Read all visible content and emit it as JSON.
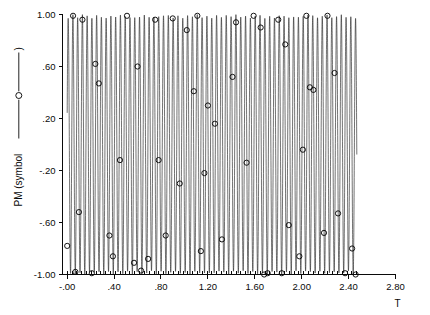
{
  "chart_data": {
    "type": "line",
    "title": "",
    "subtitle": "",
    "xlabel": "T",
    "ylabel": "PM  (symbol  ——⊕——)",
    "ylabel_text_prefix": "PM  (symbol",
    "ylabel_text_suffix": ")",
    "xlim": [
      -0.04,
      2.8
    ],
    "ylim": [
      -1.0,
      1.0
    ],
    "xticks": [
      0.0,
      0.4,
      0.8,
      1.2,
      1.6,
      2.0,
      2.4,
      2.8
    ],
    "xticklabels": [
      "-.00",
      ".40",
      ".80",
      "1.20",
      "1.60",
      "2.00",
      "2.40",
      "2.80"
    ],
    "yticks": [
      1.0,
      0.6,
      0.2,
      -0.2,
      -0.6,
      -1.0
    ],
    "yticklabels": [
      "1.00",
      ".60",
      ".20",
      "-.20",
      "-.60",
      "-1.00"
    ],
    "grid": false,
    "legend_position": "y-axis-label",
    "minor_xticks_count": 60,
    "curve_x_start": 0.0,
    "curve_x_end": 2.47,
    "oscillation_frequency_hz": 24.5,
    "envelope_amplitude": 1.0,
    "series": [
      {
        "name": "PM",
        "style": "line-with-circle-symbols",
        "marker": "open-circle",
        "marker_radius_px": 2.6,
        "color": "#1c1c1c",
        "x": [
          0.0,
          0.02,
          0.05,
          0.07,
          0.1,
          0.13,
          0.15,
          0.18,
          0.21,
          0.24,
          0.27,
          0.3,
          0.33,
          0.36,
          0.39,
          0.42,
          0.45,
          0.48,
          0.51,
          0.54,
          0.57,
          0.6,
          0.63,
          0.66,
          0.69,
          0.72,
          0.75,
          0.78,
          0.81,
          0.84,
          0.87,
          0.9,
          0.93,
          0.96,
          0.99,
          1.02,
          1.05,
          1.08,
          1.11,
          1.14,
          1.17,
          1.2,
          1.23,
          1.26,
          1.29,
          1.32,
          1.35,
          1.38,
          1.41,
          1.44,
          1.47,
          1.5,
          1.53,
          1.56,
          1.59,
          1.62,
          1.65,
          1.68,
          1.71,
          1.74,
          1.77,
          1.8,
          1.83,
          1.86,
          1.89,
          1.92,
          1.95,
          1.98,
          2.01,
          2.04,
          2.07,
          2.1,
          2.13,
          2.16,
          2.19,
          2.22,
          2.25,
          2.28,
          2.31,
          2.34,
          2.37,
          2.4,
          2.43,
          2.46
        ],
        "y": [
          -0.93,
          -1.0,
          0.98,
          -0.86,
          -0.52,
          0.96,
          -0.99,
          0.94,
          -0.99,
          0.62,
          0.47,
          -0.72,
          -0.98,
          0.99,
          -0.84,
          -0.12,
          0.99,
          -0.98,
          0.95,
          -0.86,
          -0.91,
          0.6,
          -0.99,
          0.86,
          -0.97,
          0.98,
          -0.94,
          -0.12,
          0.99,
          -0.7,
          0.93,
          -0.99,
          0.97,
          -0.3,
          -0.98,
          0.88,
          -0.99,
          0.41,
          0.99,
          -0.82,
          -0.22,
          0.3,
          -0.99,
          0.16,
          0.99,
          -0.73,
          0.98,
          -0.99,
          0.52,
          0.94,
          -0.99,
          0.97,
          -0.14,
          -0.99,
          0.99,
          -0.88,
          0.9,
          -1.0,
          -0.99,
          0.98,
          -0.92,
          0.96,
          -0.99,
          0.77,
          -0.62,
          -0.99,
          0.98,
          -0.86,
          -0.04,
          0.99,
          0.44,
          0.42,
          -0.99,
          0.96,
          -0.68,
          0.99,
          -0.98,
          0.55,
          -0.53,
          0.99,
          -0.99,
          0.97,
          -0.8,
          -1.0
        ],
        "marker_points": [
          {
            "x": 0.0,
            "y": -0.78
          },
          {
            "x": 0.05,
            "y": 0.99
          },
          {
            "x": 0.07,
            "y": -0.98
          },
          {
            "x": 0.1,
            "y": -0.52
          },
          {
            "x": 0.13,
            "y": 0.96
          },
          {
            "x": 0.21,
            "y": -0.99
          },
          {
            "x": 0.24,
            "y": 0.62
          },
          {
            "x": 0.27,
            "y": 0.47
          },
          {
            "x": 0.36,
            "y": -0.7
          },
          {
            "x": 0.39,
            "y": -0.86
          },
          {
            "x": 0.45,
            "y": -0.12
          },
          {
            "x": 0.51,
            "y": 0.99
          },
          {
            "x": 0.57,
            "y": -0.91
          },
          {
            "x": 0.6,
            "y": 0.6
          },
          {
            "x": 0.63,
            "y": -0.97
          },
          {
            "x": 0.69,
            "y": -0.88
          },
          {
            "x": 0.75,
            "y": 0.96
          },
          {
            "x": 0.78,
            "y": -0.12
          },
          {
            "x": 0.84,
            "y": -0.7
          },
          {
            "x": 0.9,
            "y": 0.97
          },
          {
            "x": 0.96,
            "y": -0.3
          },
          {
            "x": 1.02,
            "y": 0.88
          },
          {
            "x": 1.08,
            "y": 0.41
          },
          {
            "x": 1.11,
            "y": 0.99
          },
          {
            "x": 1.14,
            "y": -0.82
          },
          {
            "x": 1.17,
            "y": -0.22
          },
          {
            "x": 1.2,
            "y": 0.3
          },
          {
            "x": 1.26,
            "y": 0.16
          },
          {
            "x": 1.32,
            "y": -0.73
          },
          {
            "x": 1.41,
            "y": 0.52
          },
          {
            "x": 1.44,
            "y": 0.94
          },
          {
            "x": 1.53,
            "y": -0.14
          },
          {
            "x": 1.59,
            "y": 0.99
          },
          {
            "x": 1.65,
            "y": 0.9
          },
          {
            "x": 1.68,
            "y": -1.0
          },
          {
            "x": 1.71,
            "y": -0.99
          },
          {
            "x": 1.8,
            "y": 0.96
          },
          {
            "x": 1.83,
            "y": -0.99
          },
          {
            "x": 1.86,
            "y": 0.77
          },
          {
            "x": 1.89,
            "y": -0.62
          },
          {
            "x": 1.98,
            "y": -0.86
          },
          {
            "x": 2.01,
            "y": -0.04
          },
          {
            "x": 2.04,
            "y": 0.99
          },
          {
            "x": 2.07,
            "y": 0.44
          },
          {
            "x": 2.1,
            "y": 0.42
          },
          {
            "x": 2.19,
            "y": -0.68
          },
          {
            "x": 2.22,
            "y": 0.99
          },
          {
            "x": 2.28,
            "y": 0.55
          },
          {
            "x": 2.31,
            "y": -0.53
          },
          {
            "x": 2.37,
            "y": -0.99
          },
          {
            "x": 2.43,
            "y": -0.8
          },
          {
            "x": 2.46,
            "y": -1.0
          }
        ]
      }
    ]
  }
}
